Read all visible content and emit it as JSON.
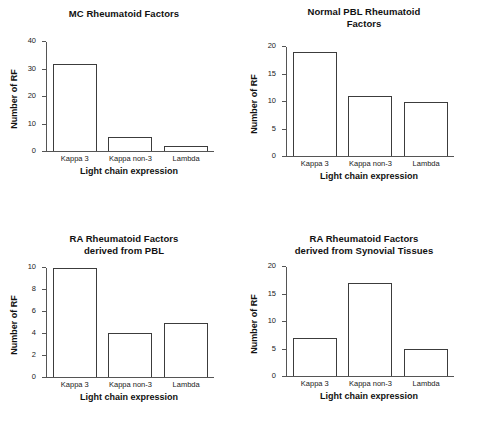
{
  "figure": {
    "background": "#ffffff",
    "axis_color": "#555555",
    "bar_outline": "#3c3c3c",
    "bar_fill": "#ffffff"
  },
  "chart_data": [
    {
      "type": "bar",
      "title": "MC Rheumatoid Factors",
      "xlabel": "Light chain expression",
      "ylabel": "Number of RF",
      "categories": [
        "Kappa 3",
        "Kappa non-3",
        "Lambda"
      ],
      "values": [
        32,
        5,
        2
      ],
      "ylim": [
        0,
        40
      ],
      "yticks": [
        0,
        10,
        20,
        30,
        40
      ],
      "grid": false,
      "legend": false
    },
    {
      "type": "bar",
      "title": "Normal PBL Rheumatoid\nFactors",
      "xlabel": "Light chain expression",
      "ylabel": "Number of RF",
      "categories": [
        "Kappa 3",
        "Kappa non-3",
        "Lambda"
      ],
      "values": [
        19,
        11,
        10
      ],
      "ylim": [
        0,
        20
      ],
      "yticks": [
        0,
        5,
        10,
        15,
        20
      ],
      "grid": false,
      "legend": false
    },
    {
      "type": "bar",
      "title": "RA Rheumatoid Factors\nderived from PBL",
      "xlabel": "Light chain expression",
      "ylabel": "Number of RF",
      "categories": [
        "Kappa 3",
        "Kappa non-3",
        "Lambda"
      ],
      "values": [
        10,
        4,
        5
      ],
      "ylim": [
        0,
        10
      ],
      "yticks": [
        0,
        2,
        4,
        6,
        8,
        10
      ],
      "grid": false,
      "legend": false
    },
    {
      "type": "bar",
      "title": "RA Rheumatoid Factors\nderived from Synovial Tissues",
      "xlabel": "Light chain expression",
      "ylabel": "Number of RF",
      "categories": [
        "Kappa 3",
        "Kappa non-3",
        "Lambda"
      ],
      "values": [
        7,
        17,
        5
      ],
      "ylim": [
        0,
        20
      ],
      "yticks": [
        0,
        5,
        10,
        15,
        20
      ],
      "grid": false,
      "legend": false
    }
  ]
}
